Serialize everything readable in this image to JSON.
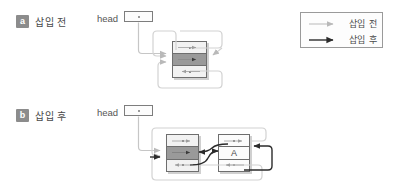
{
  "figure": {
    "title_alt": "doubly linked circular list insertion before and after",
    "colors": {
      "node_border": "#6e6e6e",
      "data_fill": "#9a9a9a",
      "pointer_fill": "#f2f2f2",
      "before_arrow": "#b9b9b9",
      "after_arrow": "#2b2b2b",
      "badge_bg": "#8c8c8c",
      "legend_border": "#9a9a9a",
      "background": "#ffffff"
    }
  },
  "panels": [
    {
      "id": "a",
      "badge": "a",
      "caption": "삽입 전",
      "head_label": "head",
      "nodes": [
        {
          "id": "existing",
          "value": "",
          "style": "data-gray"
        }
      ]
    },
    {
      "id": "b",
      "badge": "b",
      "caption": "삽입 후",
      "head_label": "head",
      "nodes": [
        {
          "id": "existing",
          "value": "",
          "style": "data-gray"
        },
        {
          "id": "inserted",
          "value": "A",
          "style": "white"
        }
      ]
    }
  ],
  "legend": {
    "items": [
      {
        "label": "삽입 전",
        "arrow": "light-arrow-icon",
        "color": "#b9b9b9"
      },
      {
        "label": "삽입 후",
        "arrow": "bold-arrow-icon",
        "color": "#2b2b2b"
      }
    ]
  }
}
